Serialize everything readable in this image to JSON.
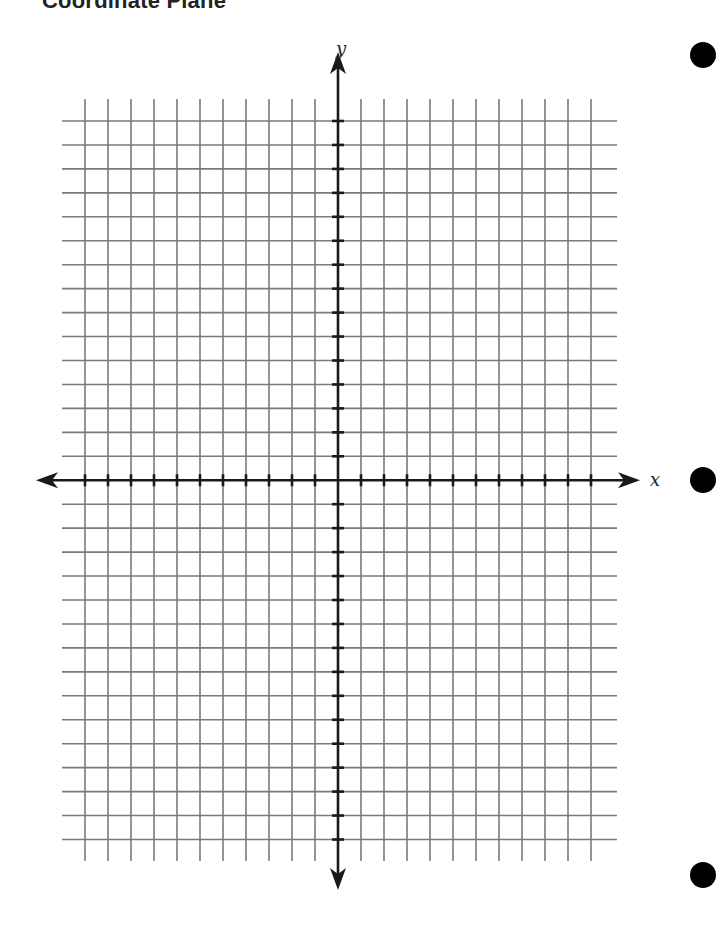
{
  "page": {
    "title": "Coordinate Plane"
  },
  "chart_data": {
    "type": "coordinate-grid",
    "title": "Coordinate Plane",
    "xlabel": "x",
    "ylabel": "y",
    "grid": true,
    "vertical_grid_lines": 23,
    "horizontal_grid_lines": 31,
    "x_range_units": [
      -11,
      11
    ],
    "y_range_units": [
      -15,
      15
    ],
    "axes_arrows": true,
    "tick_marks": true
  },
  "axes": {
    "x_label": "x",
    "y_label": "y"
  },
  "colors": {
    "grid": "#7a7a7a",
    "axis": "#1a1a1a",
    "hole": "#000000"
  }
}
